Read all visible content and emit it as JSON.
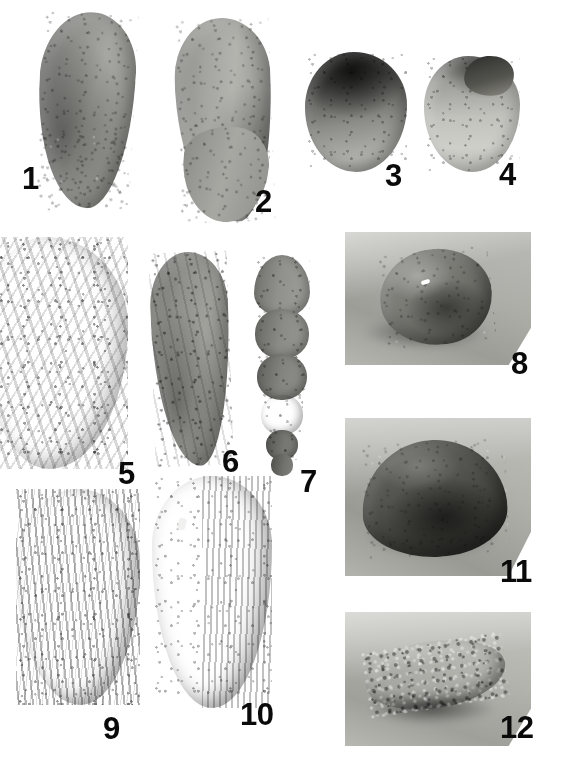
{
  "plate": {
    "title": "Foraminifera micrograph plate",
    "background_color": "#ffffff",
    "label_color": "#0a0a0a",
    "width": 581,
    "height": 761,
    "figure_count": 12
  },
  "figures": [
    {
      "id": 1,
      "label": "1",
      "kind": "specimen",
      "description": "elongate curved uniserial test, granular surface, tapering base",
      "tone": "mid-grey"
    },
    {
      "id": 2,
      "label": "2",
      "kind": "specimen",
      "description": "elongate sinuous test with swollen lower chamber, pitted surface",
      "tone": "light-grey"
    },
    {
      "id": 3,
      "label": "3",
      "kind": "specimen",
      "description": "globular rounded test, dark upper chamber, pitted lower chamber",
      "tone": "dark-grey"
    },
    {
      "id": 4,
      "label": "4",
      "kind": "specimen",
      "description": "rounded test with dark apical chamber and pale body",
      "tone": "pale-grey"
    },
    {
      "id": 5,
      "label": "5",
      "kind": "specimen",
      "description": "large broad ovate test, coarsely agglutinated rugose surface, cropped at left edge",
      "tone": "mid-grey"
    },
    {
      "id": 6,
      "label": "6",
      "kind": "specimen",
      "description": "elongate tapering test, rough agglutinated surface",
      "tone": "mid-grey"
    },
    {
      "id": 7,
      "label": "7",
      "kind": "specimen",
      "description": "uniserial tapered test with distinct chamber sutures",
      "tone": "mid-grey"
    },
    {
      "id": 8,
      "label": "8",
      "kind": "panel",
      "description": "photographic inset, grey background, rounded compressed specimen in oblique view with cast shadow",
      "tone": "mid-grey"
    },
    {
      "id": 9,
      "label": "9",
      "kind": "specimen",
      "description": "ovate test with strong longitudinal costae (ribs)",
      "tone": "dark-grey"
    },
    {
      "id": 10,
      "label": "10",
      "kind": "specimen",
      "description": "large lenticular test, finely striate on right flank, dark smooth left flank",
      "tone": "dark-grey"
    },
    {
      "id": 11,
      "label": "11",
      "kind": "panel",
      "description": "photographic inset, dark domed specimen resting on pale substrate",
      "tone": "dark-grey"
    },
    {
      "id": 12,
      "label": "12",
      "kind": "panel",
      "description": "photographic inset, elongate coarsely agglutinated specimen lying on pale substrate with shadow",
      "tone": "mid-grey"
    }
  ]
}
